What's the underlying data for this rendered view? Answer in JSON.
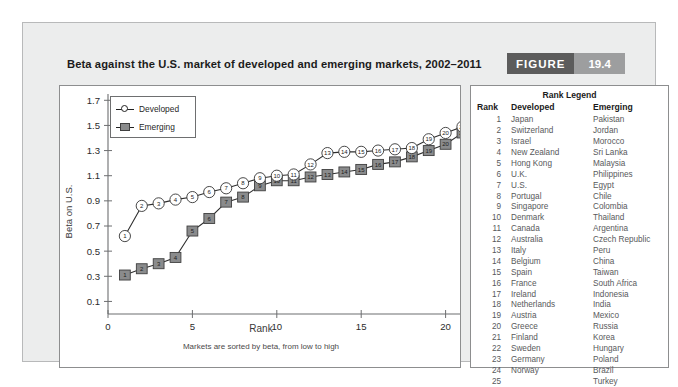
{
  "figure": {
    "title": "Beta against the U.S. market of developed and emerging markets, 2002–2011",
    "badge_word": "FIGURE",
    "badge_number": "19.4"
  },
  "chart_legend": {
    "developed": "Developed",
    "emerging": "Emerging"
  },
  "rank_legend": {
    "title": "Rank Legend",
    "headers": [
      "Rank",
      "Developed",
      "Emerging"
    ],
    "rows": [
      [
        "1",
        "Japan",
        "Pakistan"
      ],
      [
        "2",
        "Switzerland",
        "Jordan"
      ],
      [
        "3",
        "Israel",
        "Morocco"
      ],
      [
        "4",
        "New Zealand",
        "Sri Lanka"
      ],
      [
        "5",
        "Hong Kong",
        "Malaysia"
      ],
      [
        "6",
        "U.K.",
        "Philippines"
      ],
      [
        "7",
        "U.S.",
        "Egypt"
      ],
      [
        "8",
        "Portugal",
        "Chile"
      ],
      [
        "9",
        "Singapore",
        "Colombia"
      ],
      [
        "10",
        "Denmark",
        "Thailand"
      ],
      [
        "11",
        "Canada",
        "Argentina"
      ],
      [
        "12",
        "Australia",
        "Czech Republic"
      ],
      [
        "13",
        "Italy",
        "Peru"
      ],
      [
        "14",
        "Belgium",
        "China"
      ],
      [
        "15",
        "Spain",
        "Taiwan"
      ],
      [
        "16",
        "France",
        "South Africa"
      ],
      [
        "17",
        "Ireland",
        "Indonesia"
      ],
      [
        "18",
        "Netherlands",
        "India"
      ],
      [
        "19",
        "Austria",
        "Mexico"
      ],
      [
        "20",
        "Greece",
        "Russia"
      ],
      [
        "21",
        "Finland",
        "Korea"
      ],
      [
        "22",
        "Sweden",
        "Hungary"
      ],
      [
        "23",
        "Germany",
        "Poland"
      ],
      [
        "24",
        "Norway",
        "Brazil"
      ],
      [
        "25",
        "",
        "Turkey"
      ]
    ]
  },
  "chart_data": {
    "type": "line",
    "title": "Beta against the U.S. market of developed and emerging markets, 2002–2011",
    "xlabel": "Rank",
    "xsublabel": "Markets are sorted by beta, from low to high",
    "ylabel": "Beta on U.S.",
    "xlim": [
      0,
      25
    ],
    "ylim": [
      0.0,
      1.75
    ],
    "xticks": [
      0,
      5,
      10,
      15,
      20,
      25
    ],
    "yticks": [
      0.1,
      0.3,
      0.5,
      0.7,
      0.9,
      1.1,
      1.3,
      1.5,
      1.7
    ],
    "grid": false,
    "legend_position": "top-left",
    "x": [
      1,
      2,
      3,
      4,
      5,
      6,
      7,
      8,
      9,
      10,
      11,
      12,
      13,
      14,
      15,
      16,
      17,
      18,
      19,
      20,
      21,
      22,
      23,
      24,
      25
    ],
    "series": [
      {
        "name": "Developed",
        "marker": "open-circle",
        "color": "#ffffff",
        "edge_color": "#333333",
        "values": [
          0.62,
          0.86,
          0.88,
          0.91,
          0.93,
          0.97,
          1.0,
          1.04,
          1.08,
          1.1,
          1.11,
          1.19,
          1.28,
          1.29,
          1.29,
          1.3,
          1.31,
          1.32,
          1.39,
          1.44,
          1.49,
          1.47,
          1.5,
          1.5,
          null
        ]
      },
      {
        "name": "Emerging",
        "marker": "filled-square",
        "color": "#8a8b8c",
        "edge_color": "#3f3f3f",
        "values": [
          0.31,
          0.36,
          0.4,
          0.45,
          0.66,
          0.76,
          0.89,
          0.93,
          1.02,
          1.06,
          1.06,
          1.09,
          1.11,
          1.13,
          1.15,
          1.19,
          1.21,
          1.25,
          1.3,
          1.35,
          1.44,
          1.63,
          1.65,
          1.66,
          1.67
        ]
      }
    ]
  }
}
